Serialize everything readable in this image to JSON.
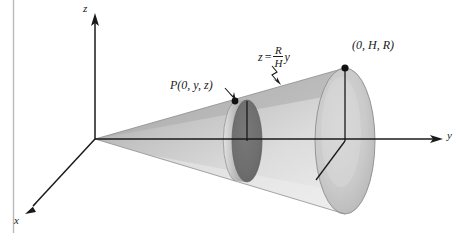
{
  "figure": {
    "background_color": "#ffffff",
    "ink_color": "#1a1a1a",
    "page_border_color": "#b9b9b9"
  },
  "axes": {
    "origin": [
      95,
      139
    ],
    "z_axis": {
      "label": "z",
      "direction": "up",
      "tip": [
        95,
        14
      ]
    },
    "y_axis": {
      "label": "y",
      "direction": "right",
      "tip": [
        443,
        139
      ]
    },
    "x_axis": {
      "label": "x",
      "direction": "down-left",
      "tip": [
        26,
        212
      ]
    }
  },
  "labels": {
    "point_p": {
      "prefix": "P",
      "text": "(0, y, z)",
      "full": "P(0, y, z)"
    },
    "top_point": {
      "text": "(0, H, R)"
    },
    "equation": {
      "lhs": "z",
      "operator": "=",
      "numerator": "R",
      "denominator": "H",
      "rhs_var": "y",
      "full": "z = R/H y"
    }
  },
  "cone": {
    "apex": [
      95,
      139
    ],
    "base_center": [
      345,
      141
    ],
    "base_radius_x": 30,
    "base_radius_y": 73,
    "fill_light": "#e9e9e9",
    "fill_mid": "#d2d2d2",
    "fill_dark": "#a6a6a6",
    "outline_color": "#8e8e8e"
  },
  "cross_section": {
    "center": [
      247,
      141
    ],
    "radius_x": 15,
    "radius_y": 41,
    "disk_fill": "#6f6f6f",
    "band_fill": "#b5b5b5",
    "band_offset": -12
  },
  "markers": {
    "p_dot": [
      235,
      101
    ],
    "top_dot": [
      345,
      68
    ],
    "dot_color": "#111111",
    "dot_radius": 3.2
  },
  "radius_lines": {
    "base_vertical": {
      "from": [
        345,
        141
      ],
      "to": [
        345,
        68
      ]
    },
    "base_diagonal": {
      "from": [
        345,
        141
      ],
      "to": [
        317,
        179
      ]
    },
    "section_vertical": {
      "from": [
        247,
        141
      ],
      "to": [
        247,
        101
      ]
    }
  }
}
